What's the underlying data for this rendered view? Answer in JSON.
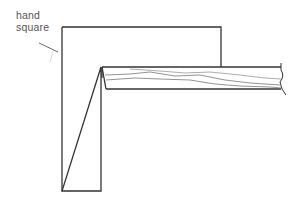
{
  "diagram": {
    "labels": {
      "line1": "hand",
      "line2": "square"
    },
    "colors": {
      "stroke": "#333333",
      "grain": "#777777",
      "leader": "#666666"
    }
  }
}
